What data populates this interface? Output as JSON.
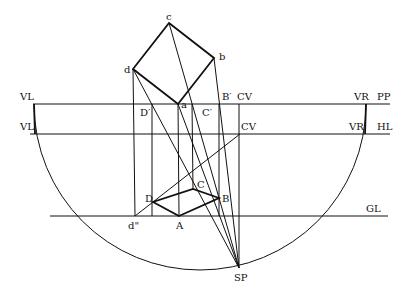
{
  "diagram": {
    "type": "perspective-construction",
    "labels": {
      "c": "c",
      "b": "b",
      "d": "d",
      "a": "a",
      "vl_pp": "VL",
      "vl_hl": "VL",
      "vr_pp": "VR",
      "vr_hl": "VR",
      "pp": "PP",
      "hl": "HL",
      "gl": "GL",
      "cv_pp": "CV",
      "cv_hl": "CV",
      "b_prime": "B′",
      "c_prime": "C′",
      "d_prime": "D′",
      "D": "D",
      "C": "C",
      "B": "B",
      "A": "A",
      "d_double_prime": "d\"",
      "sp": "SP"
    },
    "points": {
      "c": [
        169,
        23
      ],
      "b": [
        214,
        58
      ],
      "d": [
        133,
        69
      ],
      "a": [
        178,
        104
      ],
      "B_prime": [
        219,
        104
      ],
      "C_prime": [
        192,
        104
      ],
      "D_prime": [
        152,
        104
      ],
      "CV_pp": [
        239,
        104
      ],
      "CV_hl": [
        240,
        134
      ],
      "VL": [
        34,
        104
      ],
      "VR": [
        366,
        104
      ],
      "D": [
        153,
        202
      ],
      "C": [
        193,
        189
      ],
      "B": [
        219,
        198
      ],
      "A": [
        179,
        216
      ],
      "d_double_prime": [
        135,
        216
      ],
      "SP": [
        239,
        268
      ]
    },
    "lines": {
      "PP_y": 104,
      "HL_y": 134,
      "GL_y": 216
    },
    "arc": {
      "center": [
        200,
        104
      ],
      "radius": 166
    }
  }
}
